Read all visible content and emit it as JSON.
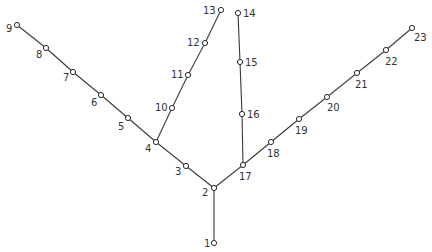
{
  "diagram": {
    "type": "tree",
    "colors": {
      "line": "#3a3a3a",
      "node_fill": "#ffffff",
      "label": "#333333"
    },
    "nodes": [
      {
        "id": "1",
        "x": 214,
        "y": 243,
        "lx": 204,
        "ly": 247,
        "anchor": "start"
      },
      {
        "id": "2",
        "x": 214,
        "y": 188,
        "lx": 202,
        "ly": 196,
        "anchor": "start"
      },
      {
        "id": "3",
        "x": 186,
        "y": 166,
        "lx": 175,
        "ly": 175,
        "anchor": "start"
      },
      {
        "id": "4",
        "x": 156,
        "y": 142,
        "lx": 145,
        "ly": 152,
        "anchor": "start"
      },
      {
        "id": "5",
        "x": 128,
        "y": 118,
        "lx": 118,
        "ly": 130,
        "anchor": "start"
      },
      {
        "id": "6",
        "x": 101,
        "y": 95,
        "lx": 91,
        "ly": 106,
        "anchor": "start"
      },
      {
        "id": "7",
        "x": 73,
        "y": 72,
        "lx": 63,
        "ly": 81,
        "anchor": "start"
      },
      {
        "id": "8",
        "x": 46,
        "y": 48,
        "lx": 36,
        "ly": 58,
        "anchor": "start"
      },
      {
        "id": "9",
        "x": 17,
        "y": 25,
        "lx": 6,
        "ly": 32,
        "anchor": "start"
      },
      {
        "id": "10",
        "x": 172,
        "y": 108,
        "lx": 155,
        "ly": 111,
        "anchor": "start"
      },
      {
        "id": "11",
        "x": 188,
        "y": 75,
        "lx": 171,
        "ly": 78,
        "anchor": "start"
      },
      {
        "id": "12",
        "x": 205,
        "y": 43,
        "lx": 187,
        "ly": 46,
        "anchor": "start"
      },
      {
        "id": "13",
        "x": 221,
        "y": 10,
        "lx": 203,
        "ly": 14,
        "anchor": "start"
      },
      {
        "id": "14",
        "x": 238,
        "y": 13,
        "lx": 243,
        "ly": 17,
        "anchor": "start"
      },
      {
        "id": "15",
        "x": 240,
        "y": 62,
        "lx": 245,
        "ly": 66,
        "anchor": "start"
      },
      {
        "id": "16",
        "x": 242,
        "y": 114,
        "lx": 247,
        "ly": 118,
        "anchor": "start"
      },
      {
        "id": "17",
        "x": 243,
        "y": 165,
        "lx": 239,
        "ly": 180,
        "anchor": "start"
      },
      {
        "id": "18",
        "x": 271,
        "y": 142,
        "lx": 267,
        "ly": 157,
        "anchor": "start"
      },
      {
        "id": "19",
        "x": 299,
        "y": 119,
        "lx": 295,
        "ly": 134,
        "anchor": "start"
      },
      {
        "id": "20",
        "x": 327,
        "y": 97,
        "lx": 327,
        "ly": 111,
        "anchor": "start"
      },
      {
        "id": "21",
        "x": 357,
        "y": 73,
        "lx": 355,
        "ly": 88,
        "anchor": "start"
      },
      {
        "id": "22",
        "x": 386,
        "y": 50,
        "lx": 385,
        "ly": 65,
        "anchor": "start"
      },
      {
        "id": "23",
        "x": 412,
        "y": 28,
        "lx": 414,
        "ly": 41,
        "anchor": "start"
      }
    ],
    "edges": [
      [
        "1",
        "2"
      ],
      [
        "2",
        "3"
      ],
      [
        "3",
        "4"
      ],
      [
        "4",
        "5"
      ],
      [
        "5",
        "6"
      ],
      [
        "6",
        "7"
      ],
      [
        "7",
        "8"
      ],
      [
        "8",
        "9"
      ],
      [
        "4",
        "10"
      ],
      [
        "10",
        "11"
      ],
      [
        "11",
        "12"
      ],
      [
        "12",
        "13"
      ],
      [
        "2",
        "17"
      ],
      [
        "17",
        "16"
      ],
      [
        "16",
        "15"
      ],
      [
        "15",
        "14"
      ],
      [
        "17",
        "18"
      ],
      [
        "18",
        "19"
      ],
      [
        "19",
        "20"
      ],
      [
        "20",
        "21"
      ],
      [
        "21",
        "22"
      ],
      [
        "22",
        "23"
      ]
    ]
  }
}
